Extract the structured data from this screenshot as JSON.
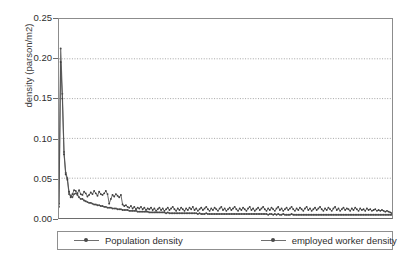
{
  "chart_data": {
    "type": "line",
    "title": "",
    "xlabel": "",
    "ylabel": "density (parson/m2)",
    "ylim": [
      0.0,
      0.25
    ],
    "yticks": [
      "0.00",
      "0.05",
      "0.10",
      "0.15",
      "0.20",
      "0.25"
    ],
    "ytick_values": [
      0.0,
      0.05,
      0.1,
      0.15,
      0.2,
      0.25
    ],
    "xlim": [
      0,
      200
    ],
    "xticks": [],
    "grid": "horizontal-dotted",
    "legend_position": "below-plot",
    "colors": {
      "series_0": "#6f6f6f",
      "series_1": "#4f4f4f",
      "grid": "#9a9a9a",
      "frame": "#8c8c8c"
    },
    "series": [
      {
        "name": "Population density",
        "marker": "dot",
        "values": [
          0.018,
          0.213,
          0.156,
          0.083,
          0.057,
          0.05,
          0.03,
          0.028,
          0.026,
          0.03,
          0.031,
          0.029,
          0.026,
          0.024,
          0.024,
          0.022,
          0.021,
          0.02,
          0.019,
          0.019,
          0.018,
          0.017,
          0.017,
          0.016,
          0.016,
          0.015,
          0.015,
          0.014,
          0.014,
          0.013,
          0.013,
          0.013,
          0.012,
          0.012,
          0.012,
          0.011,
          0.011,
          0.011,
          0.01,
          0.01,
          0.01,
          0.01,
          0.009,
          0.009,
          0.009,
          0.009,
          0.009,
          0.008,
          0.008,
          0.008,
          0.008,
          0.008,
          0.008,
          0.008,
          0.007,
          0.007,
          0.007,
          0.007,
          0.007,
          0.007,
          0.007,
          0.007,
          0.007,
          0.007,
          0.006,
          0.007,
          0.006,
          0.006,
          0.006,
          0.006,
          0.006,
          0.006,
          0.006,
          0.006,
          0.006,
          0.006,
          0.006,
          0.006,
          0.006,
          0.006,
          0.006,
          0.006,
          0.006,
          0.005,
          0.006,
          0.005,
          0.005,
          0.005,
          0.006,
          0.005,
          0.005,
          0.005,
          0.005,
          0.005,
          0.005,
          0.005,
          0.005,
          0.005,
          0.005,
          0.005,
          0.005,
          0.005,
          0.005,
          0.005,
          0.005,
          0.005,
          0.005,
          0.005,
          0.005,
          0.005,
          0.005,
          0.005,
          0.005,
          0.005,
          0.005,
          0.005,
          0.005,
          0.005,
          0.005,
          0.005,
          0.005,
          0.005,
          0.005,
          0.005,
          0.005,
          0.004,
          0.005,
          0.005,
          0.004,
          0.005,
          0.004,
          0.005,
          0.004,
          0.004,
          0.005,
          0.004,
          0.004,
          0.004,
          0.004,
          0.005,
          0.004,
          0.004,
          0.004,
          0.004,
          0.004,
          0.004,
          0.004,
          0.004,
          0.004,
          0.004,
          0.004,
          0.004,
          0.004,
          0.004,
          0.004,
          0.004,
          0.004,
          0.004,
          0.004,
          0.004,
          0.004,
          0.004,
          0.004,
          0.004,
          0.004,
          0.004,
          0.004,
          0.004,
          0.004,
          0.004,
          0.004,
          0.004,
          0.004,
          0.004,
          0.004,
          0.004,
          0.004,
          0.004,
          0.004,
          0.004,
          0.004,
          0.004,
          0.004,
          0.004,
          0.004,
          0.004,
          0.004,
          0.004,
          0.004,
          0.004,
          0.004,
          0.004,
          0.004,
          0.004,
          0.004,
          0.004,
          0.004,
          0.004,
          0.004,
          0.004
        ]
      },
      {
        "name": "employed worker density",
        "marker": "dot",
        "values": [
          0.014,
          0.196,
          0.15,
          0.08,
          0.055,
          0.048,
          0.033,
          0.026,
          0.03,
          0.035,
          0.034,
          0.031,
          0.035,
          0.03,
          0.029,
          0.033,
          0.031,
          0.027,
          0.029,
          0.032,
          0.03,
          0.034,
          0.031,
          0.028,
          0.033,
          0.03,
          0.029,
          0.031,
          0.034,
          0.03,
          0.018,
          0.024,
          0.029,
          0.027,
          0.03,
          0.028,
          0.026,
          0.029,
          0.017,
          0.015,
          0.016,
          0.014,
          0.013,
          0.015,
          0.012,
          0.014,
          0.011,
          0.013,
          0.012,
          0.014,
          0.011,
          0.013,
          0.01,
          0.012,
          0.011,
          0.013,
          0.01,
          0.012,
          0.009,
          0.011,
          0.013,
          0.01,
          0.012,
          0.009,
          0.011,
          0.013,
          0.01,
          0.012,
          0.014,
          0.011,
          0.009,
          0.012,
          0.01,
          0.013,
          0.011,
          0.009,
          0.012,
          0.01,
          0.013,
          0.011,
          0.014,
          0.01,
          0.012,
          0.009,
          0.011,
          0.013,
          0.01,
          0.012,
          0.014,
          0.011,
          0.009,
          0.012,
          0.01,
          0.013,
          0.011,
          0.009,
          0.012,
          0.014,
          0.01,
          0.012,
          0.009,
          0.011,
          0.013,
          0.01,
          0.012,
          0.014,
          0.011,
          0.009,
          0.012,
          0.01,
          0.013,
          0.011,
          0.009,
          0.012,
          0.014,
          0.01,
          0.012,
          0.009,
          0.011,
          0.013,
          0.01,
          0.012,
          0.014,
          0.011,
          0.009,
          0.012,
          0.01,
          0.013,
          0.011,
          0.009,
          0.012,
          0.014,
          0.01,
          0.012,
          0.009,
          0.011,
          0.013,
          0.01,
          0.012,
          0.014,
          0.011,
          0.009,
          0.012,
          0.01,
          0.013,
          0.011,
          0.009,
          0.012,
          0.014,
          0.01,
          0.012,
          0.009,
          0.011,
          0.013,
          0.01,
          0.012,
          0.014,
          0.011,
          0.009,
          0.012,
          0.01,
          0.013,
          0.011,
          0.009,
          0.012,
          0.014,
          0.01,
          0.012,
          0.009,
          0.011,
          0.013,
          0.01,
          0.012,
          0.011,
          0.009,
          0.012,
          0.01,
          0.013,
          0.011,
          0.009,
          0.012,
          0.01,
          0.011,
          0.009,
          0.012,
          0.01,
          0.011,
          0.009,
          0.01,
          0.011,
          0.009,
          0.01,
          0.009,
          0.01,
          0.009,
          0.008,
          0.009,
          0.008,
          0.007,
          0.006
        ]
      }
    ]
  },
  "legend": {
    "entries": [
      {
        "label": "Population density"
      },
      {
        "label": "employed worker density"
      }
    ]
  }
}
